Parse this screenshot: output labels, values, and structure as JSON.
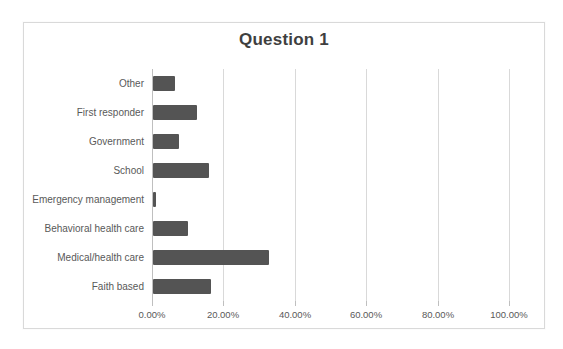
{
  "chart_data": {
    "type": "bar",
    "orientation": "horizontal",
    "title": "Question 1",
    "categories": [
      "Other",
      "First responder",
      "Government",
      "School",
      "Emergency management",
      "Behavioral health care",
      "Medical/health care",
      "Faith based"
    ],
    "values": [
      6.3,
      12.2,
      7.3,
      15.7,
      0.9,
      9.8,
      32.5,
      16.2
    ],
    "x_tick_labels": [
      "0.00%",
      "20.00%",
      "40.00%",
      "60.00%",
      "80.00%",
      "100.00%"
    ],
    "x_tick_values": [
      0,
      20,
      40,
      60,
      80,
      100
    ],
    "xlim": [
      0,
      100
    ],
    "xlabel": "",
    "ylabel": "",
    "grid": true,
    "legend": "none",
    "colors": {
      "bar": "#545454",
      "gridline": "#d9d9d9",
      "axis_line": "#bfbfbf",
      "tick": "#bfbfbf",
      "title_text": "#3f3f3f",
      "label_text": "#595959",
      "frame_border": "#d9d9d9",
      "background": "#ffffff"
    }
  }
}
